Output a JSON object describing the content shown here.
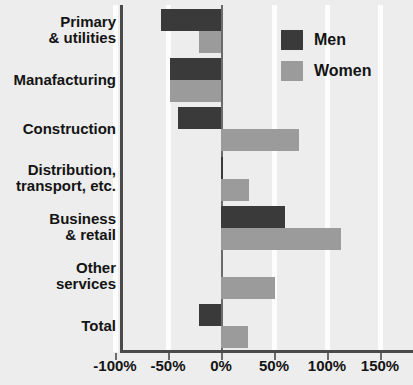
{
  "chart_data": {
    "type": "bar",
    "orientation": "horizontal",
    "title": "",
    "subtitle": "",
    "xlabel": "",
    "ylabel": "",
    "xlim": [
      -125,
      168
    ],
    "xticks": [
      -100,
      -50,
      0,
      50,
      100,
      150
    ],
    "xticklabels": [
      "-100%",
      "-50%",
      "0%",
      "50%",
      "100%",
      "150%"
    ],
    "grid": true,
    "grid_axis": "x",
    "legend_position": "top-right",
    "categories": [
      "Primary\n& utilities",
      "Manafacturing",
      "Construction",
      "Distribution,\ntransport, etc.",
      "Business\n& retail",
      "Other\nservices",
      "Total"
    ],
    "series": [
      {
        "name": "Men",
        "color": "#3a3a3a",
        "values": [
          -57,
          -48,
          -41,
          2,
          60,
          0,
          -21
        ]
      },
      {
        "name": "Women",
        "color": "#9b9b9b",
        "values": [
          -21,
          -48,
          74,
          26,
          113,
          51,
          25
        ]
      }
    ]
  },
  "legend": {
    "items": [
      {
        "label": "Men",
        "swatch": "men-swatch"
      },
      {
        "label": "Women",
        "swatch": "women-swatch"
      }
    ]
  },
  "colors": {
    "men": "#3a3a3a",
    "women": "#9b9b9b",
    "background": "#ecedec",
    "gridline": "#fdfdfd",
    "axis": "#4a4a4a",
    "text": "#141414"
  }
}
